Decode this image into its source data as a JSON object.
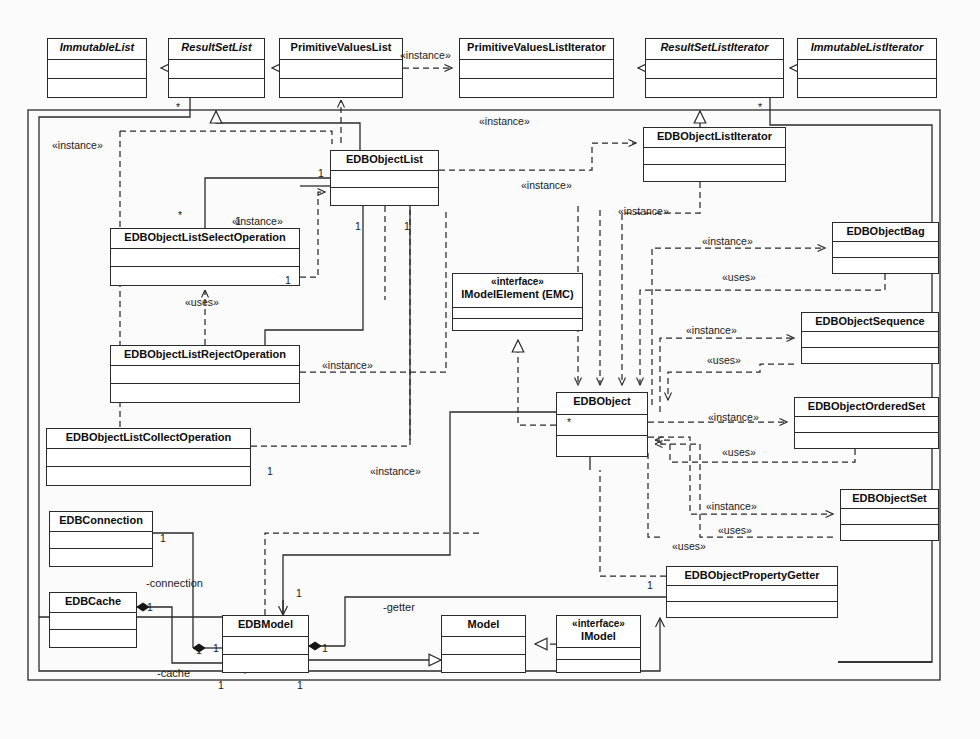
{
  "diagram": {
    "kind": "uml-class-diagram",
    "background_color": "#fbfbfb",
    "line_color": "#2a2a2a",
    "frame": {
      "x": 28,
      "y": 110,
      "width": 912,
      "height": 570
    }
  },
  "classes": [
    {
      "id": "ImmutableList",
      "name": "ImmutableList",
      "abstract": true,
      "stereotype": "",
      "x": 47,
      "y": 38,
      "w": 100,
      "h": 60,
      "name_h": 21
    },
    {
      "id": "ResultSetList",
      "name": "ResultSetList",
      "abstract": true,
      "stereotype": "",
      "x": 168,
      "y": 38,
      "w": 97,
      "h": 60,
      "name_h": 21
    },
    {
      "id": "PrimitiveValuesList",
      "name": "PrimitiveValuesList",
      "abstract": false,
      "stereotype": "",
      "x": 279,
      "y": 38,
      "w": 124,
      "h": 60,
      "name_h": 21
    },
    {
      "id": "PrimitiveValuesListIterator",
      "name": "PrimitiveValuesListIterator",
      "abstract": false,
      "stereotype": "",
      "x": 459,
      "y": 38,
      "w": 155,
      "h": 60,
      "name_h": 21
    },
    {
      "id": "ResultSetListIterator",
      "name": "ResultSetListIterator",
      "abstract": true,
      "stereotype": "",
      "x": 645,
      "y": 38,
      "w": 139,
      "h": 60,
      "name_h": 21
    },
    {
      "id": "ImmutableListIterator",
      "name": "ImmutableListIterator",
      "abstract": true,
      "stereotype": "",
      "x": 797,
      "y": 38,
      "w": 140,
      "h": 60,
      "name_h": 21
    },
    {
      "id": "EDBObjectListIterator",
      "name": "EDBObjectListIterator",
      "abstract": false,
      "stereotype": "",
      "x": 643,
      "y": 127,
      "w": 143,
      "h": 55,
      "name_h": 20
    },
    {
      "id": "EDBObjectList",
      "name": "EDBObjectList",
      "abstract": false,
      "stereotype": "",
      "x": 330,
      "y": 150,
      "w": 109,
      "h": 56,
      "name_h": 20
    },
    {
      "id": "EDBObjectListSelectOperation",
      "name": "EDBObjectListSelectOperation",
      "abstract": false,
      "stereotype": "",
      "x": 110,
      "y": 228,
      "w": 190,
      "h": 58,
      "name_h": 20
    },
    {
      "id": "EDBObjectListRejectOperation",
      "name": "EDBObjectListRejectOperation",
      "abstract": false,
      "stereotype": "",
      "x": 110,
      "y": 345,
      "w": 190,
      "h": 58,
      "name_h": 20
    },
    {
      "id": "EDBObjectListCollectOperation",
      "name": "EDBObjectListCollectOperation",
      "abstract": false,
      "stereotype": "",
      "x": 46,
      "y": 428,
      "w": 205,
      "h": 58,
      "name_h": 20
    },
    {
      "id": "IModelElement",
      "name": "IModelElement (EMC)",
      "abstract": false,
      "stereotype": "«interface»",
      "x": 452,
      "y": 273,
      "w": 131,
      "h": 58,
      "name_h": 34
    },
    {
      "id": "EDBObject",
      "name": "EDBObject",
      "abstract": false,
      "stereotype": "",
      "x": 556,
      "y": 392,
      "w": 92,
      "h": 65,
      "name_h": 22
    },
    {
      "id": "EDBObjectBag",
      "name": "EDBObjectBag",
      "abstract": false,
      "stereotype": "",
      "x": 832,
      "y": 222,
      "w": 107,
      "h": 52,
      "name_h": 19
    },
    {
      "id": "EDBObjectSequence",
      "name": "EDBObjectSequence",
      "abstract": false,
      "stereotype": "",
      "x": 801,
      "y": 312,
      "w": 138,
      "h": 52,
      "name_h": 19
    },
    {
      "id": "EDBObjectOrderedSet",
      "name": "EDBObjectOrderedSet",
      "abstract": false,
      "stereotype": "",
      "x": 794,
      "y": 397,
      "w": 145,
      "h": 52,
      "name_h": 19
    },
    {
      "id": "EDBObjectSet",
      "name": "EDBObjectSet",
      "abstract": false,
      "stereotype": "",
      "x": 840,
      "y": 489,
      "w": 99,
      "h": 52,
      "name_h": 19
    },
    {
      "id": "EDBObjectPropertyGetter",
      "name": "EDBObjectPropertyGetter",
      "abstract": false,
      "stereotype": "",
      "x": 666,
      "y": 566,
      "w": 172,
      "h": 52,
      "name_h": 19
    },
    {
      "id": "EDBConnection",
      "name": "EDBConnection",
      "abstract": false,
      "stereotype": "",
      "x": 49,
      "y": 511,
      "w": 104,
      "h": 56,
      "name_h": 20
    },
    {
      "id": "EDBCache",
      "name": "EDBCache",
      "abstract": false,
      "stereotype": "",
      "x": 49,
      "y": 592,
      "w": 88,
      "h": 56,
      "name_h": 20
    },
    {
      "id": "EDBModel",
      "name": "EDBModel",
      "abstract": false,
      "stereotype": "",
      "x": 222,
      "y": 615,
      "w": 87,
      "h": 58,
      "name_h": 21
    },
    {
      "id": "Model",
      "name": "Model",
      "abstract": false,
      "stereotype": "",
      "x": 441,
      "y": 615,
      "w": 85,
      "h": 58,
      "name_h": 21
    },
    {
      "id": "IModel",
      "name": "IModel",
      "abstract": false,
      "stereotype": "«interface»",
      "x": 556,
      "y": 615,
      "w": 85,
      "h": 58,
      "name_h": 32
    }
  ],
  "edge_labels": [
    {
      "id": "lbl-inst-pvl",
      "text": "«instance»",
      "x": 400,
      "y": 50
    },
    {
      "id": "lbl-inst-left",
      "text": "«instance»",
      "x": 52,
      "y": 140
    },
    {
      "id": "lbl-inst-top",
      "text": "«instance»",
      "x": 479,
      "y": 116
    },
    {
      "id": "lbl-inst-eol-r",
      "text": "«instance»",
      "x": 521,
      "y": 180
    },
    {
      "id": "lbl-inst-sel",
      "text": "«instance»",
      "x": 232,
      "y": 216
    },
    {
      "id": "lbl-uses-sel",
      "text": "«uses»",
      "x": 185,
      "y": 297
    },
    {
      "id": "lbl-inst-rej",
      "text": "«instance»",
      "x": 322,
      "y": 360
    },
    {
      "id": "lbl-inst-col",
      "text": "«instance»",
      "x": 370,
      "y": 466
    },
    {
      "id": "lbl-inst-iter2",
      "text": "«instance»",
      "x": 618,
      "y": 206
    },
    {
      "id": "lbl-inst-bag",
      "text": "«instance»",
      "x": 702,
      "y": 236
    },
    {
      "id": "lbl-uses-bag",
      "text": "«uses»",
      "x": 722,
      "y": 272
    },
    {
      "id": "lbl-inst-seq",
      "text": "«instance»",
      "x": 686,
      "y": 325
    },
    {
      "id": "lbl-uses-seq",
      "text": "«uses»",
      "x": 707,
      "y": 355
    },
    {
      "id": "lbl-inst-ord",
      "text": "«instance»",
      "x": 708,
      "y": 412
    },
    {
      "id": "lbl-uses-ord",
      "text": "«uses»",
      "x": 722,
      "y": 447
    },
    {
      "id": "lbl-inst-set",
      "text": "«instance»",
      "x": 706,
      "y": 501
    },
    {
      "id": "lbl-uses-set",
      "text": "«uses»",
      "x": 718,
      "y": 525
    },
    {
      "id": "lbl-uses-set2",
      "text": "«uses»",
      "x": 672,
      "y": 541
    }
  ],
  "multiplicities": [
    {
      "id": "m-rsl-star",
      "text": "*",
      "x": 176,
      "y": 102
    },
    {
      "id": "m-rsli-star",
      "text": "*",
      "x": 758,
      "y": 102
    },
    {
      "id": "m-eol-1a",
      "text": "1",
      "x": 318,
      "y": 168
    },
    {
      "id": "m-eol-1b",
      "text": "1",
      "x": 404,
      "y": 221
    },
    {
      "id": "m-eol-1c",
      "text": "1",
      "x": 355,
      "y": 221
    },
    {
      "id": "m-eol-star",
      "text": "*",
      "x": 178,
      "y": 210
    },
    {
      "id": "m-sel-1top",
      "text": "1",
      "x": 235,
      "y": 216
    },
    {
      "id": "m-sel-1r",
      "text": "1",
      "x": 285,
      "y": 275
    },
    {
      "id": "m-col-1",
      "text": "1",
      "x": 267,
      "y": 466
    },
    {
      "id": "m-obj-star",
      "text": "*",
      "x": 567,
      "y": 417
    },
    {
      "id": "m-conn-1",
      "text": "1",
      "x": 160,
      "y": 533
    },
    {
      "id": "m-cache-1",
      "text": "1",
      "x": 147,
      "y": 602
    },
    {
      "id": "m-model-1a",
      "text": "1",
      "x": 196,
      "y": 645
    },
    {
      "id": "m-model-1b",
      "text": "1",
      "x": 213,
      "y": 643
    },
    {
      "id": "m-model-1c",
      "text": "1",
      "x": 322,
      "y": 643
    },
    {
      "id": "m-model-1d",
      "text": "1",
      "x": 218,
      "y": 680
    },
    {
      "id": "m-model-1e",
      "text": "1",
      "x": 297,
      "y": 680
    },
    {
      "id": "m-model-1f",
      "text": "1",
      "x": 296,
      "y": 588
    },
    {
      "id": "m-getter-1",
      "text": "1",
      "x": 647,
      "y": 580
    }
  ],
  "roles": [
    {
      "id": "role-connection",
      "text": "-connection",
      "x": 146,
      "y": 578
    },
    {
      "id": "role-cache",
      "text": "-cache",
      "x": 157,
      "y": 668
    },
    {
      "id": "role-getter",
      "text": "-getter",
      "x": 383,
      "y": 602
    }
  ]
}
